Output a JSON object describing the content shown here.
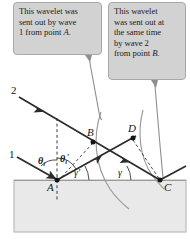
{
  "figure": {
    "name": "huygens-reflection-construction",
    "background_color": "#ffffff",
    "medium": {
      "fill_color": "#e9e9e9",
      "border_color": "#b0b0b0"
    },
    "ray_color": "#2b2b2b",
    "arc_color": "#9a9a9a",
    "callout_fill": "#d2d2d2",
    "callout_border": "#a8a8a8"
  },
  "callouts": {
    "left": {
      "lines": [
        "This wavelet was",
        "sent out by wave",
        "1 from point "
      ],
      "line1": "This wavelet was",
      "line2": "sent out by wave",
      "line3": "1 from point",
      "point_label": "A."
    },
    "right": {
      "line1": "This wavelet",
      "line2": "was sent out at",
      "line3": "the same time",
      "line4": "by wave 2",
      "line5": "from point",
      "point_label": "B."
    }
  },
  "labels": {
    "ray1": "1",
    "ray2": "2",
    "point_a": "A",
    "point_b": "B",
    "point_c": "C",
    "point_d": "D",
    "theta_i": "θ",
    "theta_i_sub": "i",
    "theta_i_prime": "θ",
    "theta_i_prime_sub": "i",
    "theta_i_prime_mark": "′",
    "gamma_prime": "γ′",
    "gamma": "γ"
  }
}
